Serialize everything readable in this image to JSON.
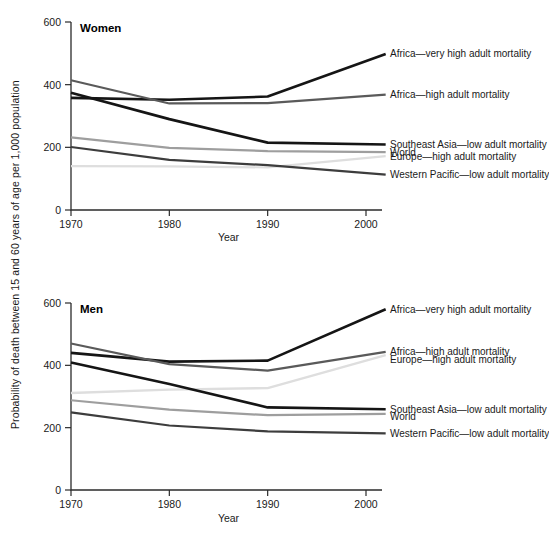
{
  "figure": {
    "y_axis_label": "Probability of death between 15 and 60 years of age per 1,000 population"
  },
  "chart_data": [
    {
      "type": "line",
      "title": "Women",
      "xlabel": "Year",
      "ylabel": "Probability of death between 15 and 60 years of age per 1,000 population",
      "x": [
        1970,
        1980,
        1990,
        2002
      ],
      "xticks": [
        "1970",
        "1980",
        "1990",
        "2000"
      ],
      "xtickvalues": [
        1970,
        1980,
        1990,
        2000
      ],
      "yticks": [
        "0",
        "200",
        "400",
        "600"
      ],
      "ytickvalues": [
        0,
        200,
        400,
        600
      ],
      "xlim": [
        1970,
        2002
      ],
      "ylim": [
        0,
        600
      ],
      "grid": false,
      "legend_position": "right-of-plot",
      "series": [
        {
          "name": "Africa—very high adult mortality",
          "color": "#151515",
          "width": 2.6,
          "values": [
            358,
            352,
            362,
            498
          ]
        },
        {
          "name": "Africa—high adult mortality",
          "color": "#5a5a5a",
          "width": 2.2,
          "values": [
            414,
            340,
            341,
            368
          ]
        },
        {
          "name": "Southeast Asia—low adult mortality",
          "color": "#151515",
          "width": 2.6,
          "values": [
            374,
            290,
            215,
            209
          ]
        },
        {
          "name": "World",
          "color": "#9e9e9e",
          "width": 2.2,
          "values": [
            232,
            198,
            188,
            185
          ]
        },
        {
          "name": "Europe—high adult mortality",
          "color": "#dedede",
          "width": 2.2,
          "values": [
            140,
            139,
            136,
            172
          ]
        },
        {
          "name": "Western Pacific—low adult mortality",
          "color": "#3d3d3d",
          "width": 2.2,
          "values": [
            201,
            160,
            143,
            113
          ]
        }
      ],
      "annotations": [
        {
          "text": "Africa—very high adult mortality",
          "at_y": 498
        },
        {
          "text": "Africa—high adult mortality",
          "at_y": 368
        },
        {
          "text": "Southeast Asia—low adult mortality",
          "at_y": 209
        },
        {
          "text": "World",
          "at_y": 185
        },
        {
          "text": "Europe—high adult mortality",
          "at_y": 172
        },
        {
          "text": "Western Pacific—low adult mortality",
          "at_y": 113
        }
      ]
    },
    {
      "type": "line",
      "title": "Men",
      "xlabel": "Year",
      "ylabel": "Probability of death between 15 and 60 years of age per 1,000 population",
      "x": [
        1970,
        1980,
        1990,
        2002
      ],
      "xticks": [
        "1970",
        "1980",
        "1990",
        "2000"
      ],
      "xtickvalues": [
        1970,
        1980,
        1990,
        2000
      ],
      "yticks": [
        "0",
        "200",
        "400",
        "600"
      ],
      "ytickvalues": [
        0,
        200,
        400,
        600
      ],
      "xlim": [
        1970,
        2002
      ],
      "ylim": [
        0,
        600
      ],
      "grid": false,
      "legend_position": "right-of-plot",
      "series": [
        {
          "name": "Africa—very high adult mortality",
          "color": "#151515",
          "width": 2.6,
          "values": [
            440,
            412,
            415,
            580
          ]
        },
        {
          "name": "Africa—high adult mortality",
          "color": "#5a5a5a",
          "width": 2.2,
          "values": [
            470,
            404,
            383,
            443
          ]
        },
        {
          "name": "Europe—high adult mortality",
          "color": "#dedede",
          "width": 2.4,
          "values": [
            311,
            322,
            327,
            433
          ]
        },
        {
          "name": "Southeast Asia—low adult mortality",
          "color": "#151515",
          "width": 2.6,
          "values": [
            409,
            340,
            265,
            259
          ]
        },
        {
          "name": "World",
          "color": "#9e9e9e",
          "width": 2.2,
          "values": [
            288,
            258,
            240,
            244
          ]
        },
        {
          "name": "Western Pacific—low adult mortality",
          "color": "#3d3d3d",
          "width": 2.2,
          "values": [
            249,
            207,
            188,
            182
          ]
        }
      ],
      "annotations": [
        {
          "text": "Africa—very high adult mortality",
          "at_y": 580
        },
        {
          "text": "Africa—high adult mortality",
          "at_y": 443
        },
        {
          "text": "Europe—high adult mortality",
          "at_y": 419
        },
        {
          "text": "Southeast Asia—low adult mortality",
          "at_y": 259
        },
        {
          "text": "World",
          "at_y": 236
        },
        {
          "text": "Western Pacific—low adult mortality",
          "at_y": 182
        }
      ]
    }
  ]
}
